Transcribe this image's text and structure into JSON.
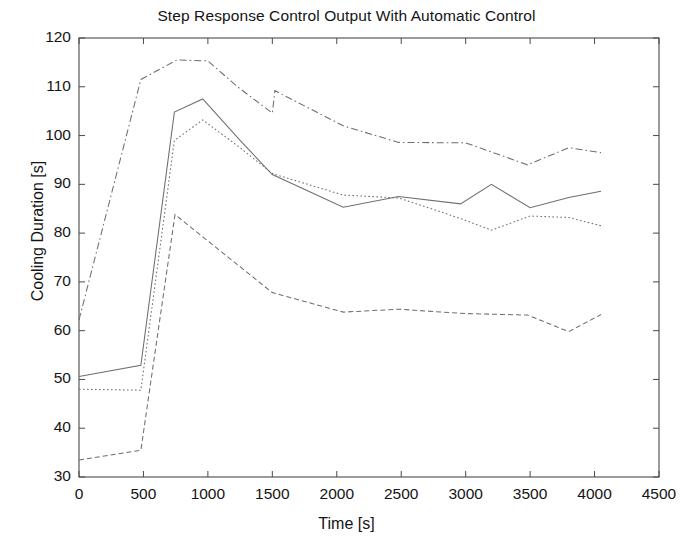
{
  "chart_data": {
    "type": "line",
    "title": "Step Response Control Output With Automatic Control",
    "xlabel": "Time [s]",
    "ylabel": "Cooling Duration [s]",
    "xlim": [
      0,
      4500
    ],
    "ylim": [
      30,
      120
    ],
    "xticks": [
      0,
      500,
      1000,
      1500,
      2000,
      2500,
      3000,
      3500,
      4000,
      4500
    ],
    "yticks": [
      30,
      40,
      50,
      60,
      70,
      80,
      90,
      100,
      110,
      120
    ],
    "xtick_labels": [
      "0",
      "500",
      "1000",
      "1500",
      "2000",
      "2500",
      "3000",
      "3500",
      "4000",
      "4500"
    ],
    "ytick_labels": [
      "30",
      "40",
      "50",
      "60",
      "70",
      "80",
      "90",
      "100",
      "110",
      "120"
    ],
    "grid": false,
    "legend": "none",
    "line_color": "#6e6e6e",
    "axis_color": "#4a4a4a",
    "series": [
      {
        "name": "series-1",
        "style": "dash-dot",
        "points": [
          [
            0,
            62.2
          ],
          [
            480,
            111.5
          ],
          [
            760,
            115.5
          ],
          [
            1000,
            115.3
          ],
          [
            1230,
            110.0
          ],
          [
            1500,
            104.6
          ],
          [
            1520,
            109.2
          ],
          [
            2050,
            102.0
          ],
          [
            2480,
            98.6
          ],
          [
            3000,
            98.5
          ],
          [
            3480,
            94.0
          ],
          [
            3800,
            97.5
          ],
          [
            4050,
            96.5
          ]
        ]
      },
      {
        "name": "series-2",
        "style": "solid",
        "points": [
          [
            0,
            50.6
          ],
          [
            480,
            52.9
          ],
          [
            740,
            104.8
          ],
          [
            960,
            107.5
          ],
          [
            1250,
            99.0
          ],
          [
            1500,
            92.0
          ],
          [
            2050,
            85.3
          ],
          [
            2480,
            87.5
          ],
          [
            2960,
            86.0
          ],
          [
            3200,
            90.0
          ],
          [
            3500,
            85.2
          ],
          [
            3800,
            87.3
          ],
          [
            4050,
            88.6
          ]
        ]
      },
      {
        "name": "series-3",
        "style": "dotted",
        "points": [
          [
            0,
            48.0
          ],
          [
            480,
            47.8
          ],
          [
            740,
            99.0
          ],
          [
            960,
            103.2
          ],
          [
            1250,
            97.5
          ],
          [
            1500,
            92.2
          ],
          [
            2050,
            87.8
          ],
          [
            2480,
            87.2
          ],
          [
            2960,
            83.0
          ],
          [
            3200,
            80.6
          ],
          [
            3500,
            83.5
          ],
          [
            3800,
            83.2
          ],
          [
            4050,
            81.5
          ]
        ]
      },
      {
        "name": "series-4",
        "style": "dashed",
        "points": [
          [
            0,
            33.5
          ],
          [
            480,
            35.5
          ],
          [
            745,
            83.8
          ],
          [
            1500,
            67.8
          ],
          [
            2050,
            63.8
          ],
          [
            2480,
            64.4
          ],
          [
            3000,
            63.5
          ],
          [
            3480,
            63.2
          ],
          [
            3800,
            59.8
          ],
          [
            4050,
            63.3
          ]
        ]
      }
    ]
  }
}
